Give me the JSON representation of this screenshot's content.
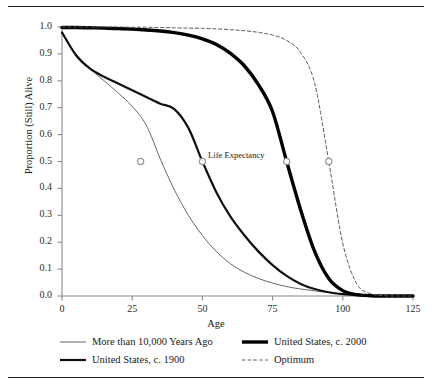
{
  "figure": {
    "top_rule": "",
    "bottom_rule": ""
  },
  "annotations": {
    "life_expectancy": "Life Expectancy"
  },
  "chart_data": {
    "type": "line",
    "title": "",
    "xlabel": "Age",
    "ylabel": "Proportion (Still) Alive",
    "xlim": [
      0,
      125
    ],
    "ylim": [
      0.0,
      1.0
    ],
    "xticks": [
      0,
      25,
      50,
      75,
      100,
      125
    ],
    "xtick_labels": [
      "0",
      "25",
      "50",
      "75",
      "100",
      "125"
    ],
    "yticks": [
      0.0,
      0.1,
      0.2,
      0.3,
      0.4,
      0.5,
      0.6,
      0.7,
      0.8,
      0.9,
      1.0
    ],
    "ytick_labels": [
      "0.0",
      "0.1",
      "0.2",
      "0.3",
      "0.4",
      "0.5",
      "0.6",
      "0.7",
      "0.8",
      "0.9",
      "1.0"
    ],
    "grid": false,
    "legend_position": "below-axes",
    "annotation_label": "Life Expectancy",
    "marker_note": "Open gray circles mark each curve's median survival (life expectancy) at proportion 0.5",
    "x": [
      0,
      5,
      10,
      15,
      20,
      25,
      30,
      35,
      40,
      45,
      50,
      55,
      60,
      65,
      70,
      75,
      80,
      85,
      90,
      95,
      100,
      105,
      110,
      115,
      120,
      125
    ],
    "series": [
      {
        "name": "More than 10,000 Years Ago",
        "style": "thin-solid",
        "color": "#555555",
        "life_expectancy": 28,
        "values": [
          0.975,
          0.9,
          0.845,
          0.8,
          0.755,
          0.705,
          0.635,
          0.51,
          0.395,
          0.3,
          0.225,
          0.165,
          0.12,
          0.088,
          0.065,
          0.048,
          0.035,
          0.026,
          0.019,
          0.013,
          0.008,
          0.005,
          0.003,
          0.001,
          0.0,
          0.0
        ]
      },
      {
        "name": "United States, c. 1900",
        "style": "thick-solid",
        "color": "#111111",
        "life_expectancy": 50,
        "values": [
          0.98,
          0.895,
          0.845,
          0.815,
          0.79,
          0.765,
          0.74,
          0.715,
          0.695,
          0.625,
          0.5,
          0.385,
          0.295,
          0.225,
          0.165,
          0.115,
          0.075,
          0.045,
          0.026,
          0.014,
          0.007,
          0.003,
          0.001,
          0.0,
          0.0,
          0.0
        ]
      },
      {
        "name": "United States, c. 2000",
        "style": "extra-thick-solid",
        "color": "#000000",
        "life_expectancy": 80,
        "values": [
          0.998,
          0.998,
          0.997,
          0.996,
          0.994,
          0.992,
          0.989,
          0.985,
          0.979,
          0.97,
          0.956,
          0.935,
          0.902,
          0.855,
          0.785,
          0.685,
          0.5,
          0.32,
          0.165,
          0.065,
          0.02,
          0.005,
          0.001,
          0.0,
          0.0,
          0.0
        ]
      },
      {
        "name": "Optimum",
        "style": "dashed",
        "color": "#555555",
        "life_expectancy": 95,
        "values": [
          1.0,
          1.0,
          1.0,
          1.0,
          1.0,
          0.999,
          0.999,
          0.998,
          0.997,
          0.996,
          0.995,
          0.993,
          0.99,
          0.986,
          0.98,
          0.97,
          0.95,
          0.905,
          0.79,
          0.5,
          0.195,
          0.045,
          0.008,
          0.001,
          0.0,
          0.0
        ]
      }
    ]
  },
  "legend": {
    "items": [
      {
        "label": "More than 10,000 Years Ago",
        "style": "thin-solid"
      },
      {
        "label": "United States, c. 1900",
        "style": "thick-solid"
      },
      {
        "label": "United States, c. 2000",
        "style": "extra-thick-solid"
      },
      {
        "label": "Optimum",
        "style": "dashed"
      }
    ]
  }
}
